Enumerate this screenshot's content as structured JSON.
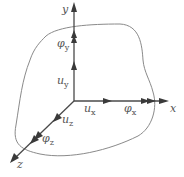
{
  "diagram": {
    "type": "3d-coordinate-system-body",
    "colors": {
      "axis": "#4a4a4a",
      "outline": "#8a8a8a",
      "text": "#555555",
      "background": "#ffffff"
    },
    "axes": {
      "x": {
        "label": "x"
      },
      "y": {
        "label": "y"
      },
      "z": {
        "label": "z"
      }
    },
    "displacements": {
      "ux": {
        "symbol": "u",
        "sub": "x"
      },
      "uy": {
        "symbol": "u",
        "sub": "y"
      },
      "uz": {
        "symbol": "u",
        "sub": "z"
      }
    },
    "rotations": {
      "phix": {
        "symbol": "φ",
        "sub": "x"
      },
      "phiy": {
        "symbol": "φ",
        "sub": "y"
      },
      "phiz": {
        "symbol": "φ",
        "sub": "z"
      }
    }
  }
}
